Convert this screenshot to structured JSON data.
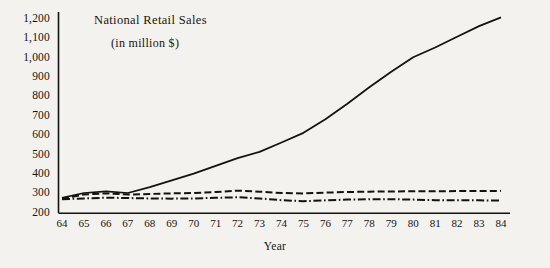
{
  "chart_data": {
    "type": "line",
    "title": "National Retail Sales",
    "subtitle": "(in million $)",
    "xlabel": "Year",
    "ylabel": "",
    "x": [
      64,
      65,
      66,
      67,
      68,
      69,
      70,
      71,
      72,
      73,
      74,
      75,
      76,
      77,
      78,
      79,
      80,
      81,
      82,
      83,
      84
    ],
    "xtick_labels": [
      "64",
      "65",
      "66",
      "67",
      "68",
      "69",
      "70",
      "71",
      "72",
      "73",
      "74",
      "75",
      "76",
      "77",
      "78",
      "79",
      "80",
      "81",
      "82",
      "83",
      "84"
    ],
    "ytick_labels": [
      "1,200",
      "1,100",
      "1,000",
      "900",
      "800",
      "700",
      "600",
      "500",
      "400",
      "300",
      "200"
    ],
    "ytick_values": [
      1200,
      1100,
      1000,
      900,
      800,
      700,
      600,
      500,
      400,
      300,
      200
    ],
    "xlim": [
      64,
      84
    ],
    "ylim": [
      200,
      1200
    ],
    "grid": false,
    "legend": "none",
    "line_color": "#141210",
    "background_color": "#f4f2ee",
    "series": [
      {
        "name": "series-solid",
        "style": "solid",
        "values": [
          275,
          300,
          308,
          300,
          330,
          365,
          400,
          440,
          480,
          512,
          560,
          610,
          680,
          760,
          845,
          925,
          1000,
          1050,
          1105,
          1160,
          1205
        ]
      },
      {
        "name": "series-dashed",
        "style": "dashed",
        "values": [
          272,
          292,
          298,
          292,
          295,
          298,
          300,
          305,
          312,
          307,
          300,
          298,
          302,
          305,
          307,
          308,
          309,
          309,
          310,
          310,
          311
        ]
      },
      {
        "name": "series-dash-dot",
        "style": "dash-dot",
        "values": [
          268,
          272,
          276,
          274,
          272,
          271,
          272,
          275,
          278,
          272,
          263,
          258,
          262,
          266,
          268,
          268,
          266,
          263,
          262,
          262,
          261
        ]
      }
    ]
  }
}
